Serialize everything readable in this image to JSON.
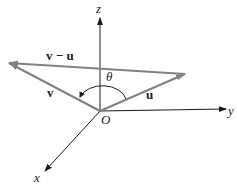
{
  "diagram": {
    "type": "3d-vector-diagram",
    "axes": {
      "z": {
        "label": "z"
      },
      "y": {
        "label": "y"
      },
      "x": {
        "label": "x"
      }
    },
    "origin": {
      "label": "O"
    },
    "vectors": {
      "v": {
        "label": "v"
      },
      "u": {
        "label": "u"
      },
      "v_minus_u": {
        "label": "v − u"
      }
    },
    "angle": {
      "label": "θ"
    },
    "colors": {
      "axis": "#1a1a1a",
      "vector": "#808080",
      "background": "#ffffff"
    }
  }
}
